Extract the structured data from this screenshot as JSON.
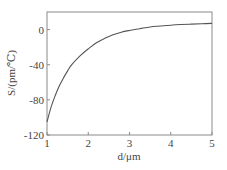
{
  "chart_data": {
    "type": "line",
    "title": "",
    "xlabel": "d/μm",
    "ylabel": "S/(pm/℃)",
    "xlim": [
      1,
      5
    ],
    "ylim": [
      -120,
      20
    ],
    "xticks": [
      1,
      2,
      3,
      4,
      5
    ],
    "yticks": [
      0,
      -40,
      -80,
      -120
    ],
    "xtick_labels": [
      "1",
      "2",
      "3",
      "4",
      "5"
    ],
    "ytick_labels": [
      "0",
      "-40",
      "-80",
      "-120"
    ],
    "grid": false,
    "legend": null,
    "series": [
      {
        "name": "S",
        "color": "#555555",
        "x": [
          1.0,
          1.1,
          1.2,
          1.3,
          1.4,
          1.5,
          1.6,
          1.8,
          2.0,
          2.2,
          2.4,
          2.6,
          2.8,
          3.0,
          3.25,
          3.5,
          3.75,
          4.0,
          4.25,
          4.5,
          4.75,
          5.0
        ],
        "y": [
          -105,
          -88,
          -75,
          -64,
          -55,
          -47,
          -40,
          -30,
          -22,
          -15,
          -10,
          -6,
          -3,
          -1,
          1,
          3,
          4,
          5,
          5.7,
          6.2,
          6.6,
          7
        ]
      }
    ]
  },
  "plot": {
    "frame_color": "#888888",
    "line_color": "#555555"
  }
}
